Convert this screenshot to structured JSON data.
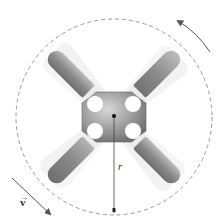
{
  "diagram": {
    "labels": {
      "radius": "r",
      "velocity": "v"
    },
    "elements": {
      "path_circle": "dashed circular path",
      "rotation_arrow": "counterclockwise rotation arrow",
      "velocity_arrow": "tangential velocity vector",
      "radius_line": "radius from center to path",
      "hub": "central hub",
      "arms": 4
    },
    "colors": {
      "arm": "#8a8a8a",
      "arm_tip": "#e8e8e8",
      "hub": "#9a9a9a",
      "dashed_circle": "#9a9a9a",
      "arrow": "#555555"
    }
  }
}
